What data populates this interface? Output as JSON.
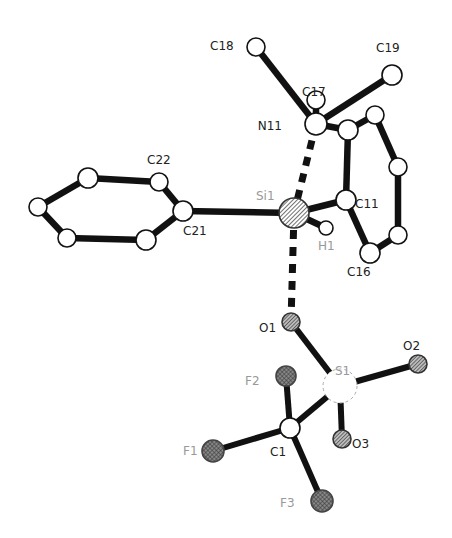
{
  "diagram": {
    "type": "ortep-molecular-structure",
    "atoms": [
      {
        "id": "N11",
        "label": "N11",
        "element": "N",
        "style": "open"
      },
      {
        "id": "C17",
        "label": "C17",
        "element": "C",
        "style": "open"
      },
      {
        "id": "C18",
        "label": "C18",
        "element": "C",
        "style": "open"
      },
      {
        "id": "C19",
        "label": "C19",
        "element": "C",
        "style": "open"
      },
      {
        "id": "Si1",
        "label": "Si1",
        "element": "Si",
        "style": "hatched"
      },
      {
        "id": "H1",
        "label": "H1",
        "element": "H",
        "style": "open-small"
      },
      {
        "id": "C11",
        "label": "C11",
        "element": "C",
        "style": "open"
      },
      {
        "id": "C12",
        "label": "",
        "element": "C",
        "style": "open"
      },
      {
        "id": "C13",
        "label": "",
        "element": "C",
        "style": "open"
      },
      {
        "id": "C14",
        "label": "",
        "element": "C",
        "style": "open"
      },
      {
        "id": "C15",
        "label": "",
        "element": "C",
        "style": "open"
      },
      {
        "id": "C16",
        "label": "C16",
        "element": "C",
        "style": "open"
      },
      {
        "id": "C21",
        "label": "C21",
        "element": "C",
        "style": "open"
      },
      {
        "id": "C22",
        "label": "C22",
        "element": "C",
        "style": "open"
      },
      {
        "id": "C23",
        "label": "",
        "element": "C",
        "style": "open"
      },
      {
        "id": "C24",
        "label": "",
        "element": "C",
        "style": "open"
      },
      {
        "id": "C25",
        "label": "",
        "element": "C",
        "style": "open"
      },
      {
        "id": "C26",
        "label": "",
        "element": "C",
        "style": "open"
      },
      {
        "id": "O1",
        "label": "O1",
        "element": "O",
        "style": "hatched-o"
      },
      {
        "id": "S1",
        "label": "S1",
        "element": "S",
        "style": "dashed-faint"
      },
      {
        "id": "O2",
        "label": "O2",
        "element": "O",
        "style": "hatched-o"
      },
      {
        "id": "O3",
        "label": "O3",
        "element": "O",
        "style": "hatched-o"
      },
      {
        "id": "C1",
        "label": "C1",
        "element": "C",
        "style": "open"
      },
      {
        "id": "F1",
        "label": "F1",
        "element": "F",
        "style": "crosshatched"
      },
      {
        "id": "F2",
        "label": "F2",
        "element": "F",
        "style": "crosshatched"
      },
      {
        "id": "F3",
        "label": "F3",
        "element": "F",
        "style": "crosshatched"
      }
    ],
    "bonds": [
      {
        "a": "N11",
        "b": "C17",
        "type": "solid"
      },
      {
        "a": "N11",
        "b": "C18",
        "type": "solid"
      },
      {
        "a": "N11",
        "b": "C19",
        "type": "solid"
      },
      {
        "a": "N11",
        "b": "C12",
        "type": "solid"
      },
      {
        "a": "N11",
        "b": "Si1",
        "type": "dashed"
      },
      {
        "a": "C12",
        "b": "C13",
        "type": "solid"
      },
      {
        "a": "C12",
        "b": "C11",
        "type": "solid"
      },
      {
        "a": "C13",
        "b": "C14",
        "type": "solid"
      },
      {
        "a": "C14",
        "b": "C15",
        "type": "solid"
      },
      {
        "a": "C15",
        "b": "C16",
        "type": "solid"
      },
      {
        "a": "C16",
        "b": "C11",
        "type": "solid"
      },
      {
        "a": "Si1",
        "b": "C11",
        "type": "solid"
      },
      {
        "a": "Si1",
        "b": "H1",
        "type": "solid"
      },
      {
        "a": "Si1",
        "b": "C21",
        "type": "solid"
      },
      {
        "a": "Si1",
        "b": "O1",
        "type": "dashed"
      },
      {
        "a": "C21",
        "b": "C22",
        "type": "solid"
      },
      {
        "a": "C22",
        "b": "C23",
        "type": "solid"
      },
      {
        "a": "C23",
        "b": "C24",
        "type": "solid"
      },
      {
        "a": "C24",
        "b": "C25",
        "type": "solid"
      },
      {
        "a": "C25",
        "b": "C26",
        "type": "solid"
      },
      {
        "a": "C26",
        "b": "C21",
        "type": "solid"
      },
      {
        "a": "O1",
        "b": "S1",
        "type": "solid"
      },
      {
        "a": "S1",
        "b": "O2",
        "type": "solid"
      },
      {
        "a": "S1",
        "b": "O3",
        "type": "solid"
      },
      {
        "a": "S1",
        "b": "C1",
        "type": "solid"
      },
      {
        "a": "C1",
        "b": "F1",
        "type": "solid"
      },
      {
        "a": "C1",
        "b": "F2",
        "type": "solid"
      },
      {
        "a": "C1",
        "b": "F3",
        "type": "solid"
      }
    ]
  }
}
